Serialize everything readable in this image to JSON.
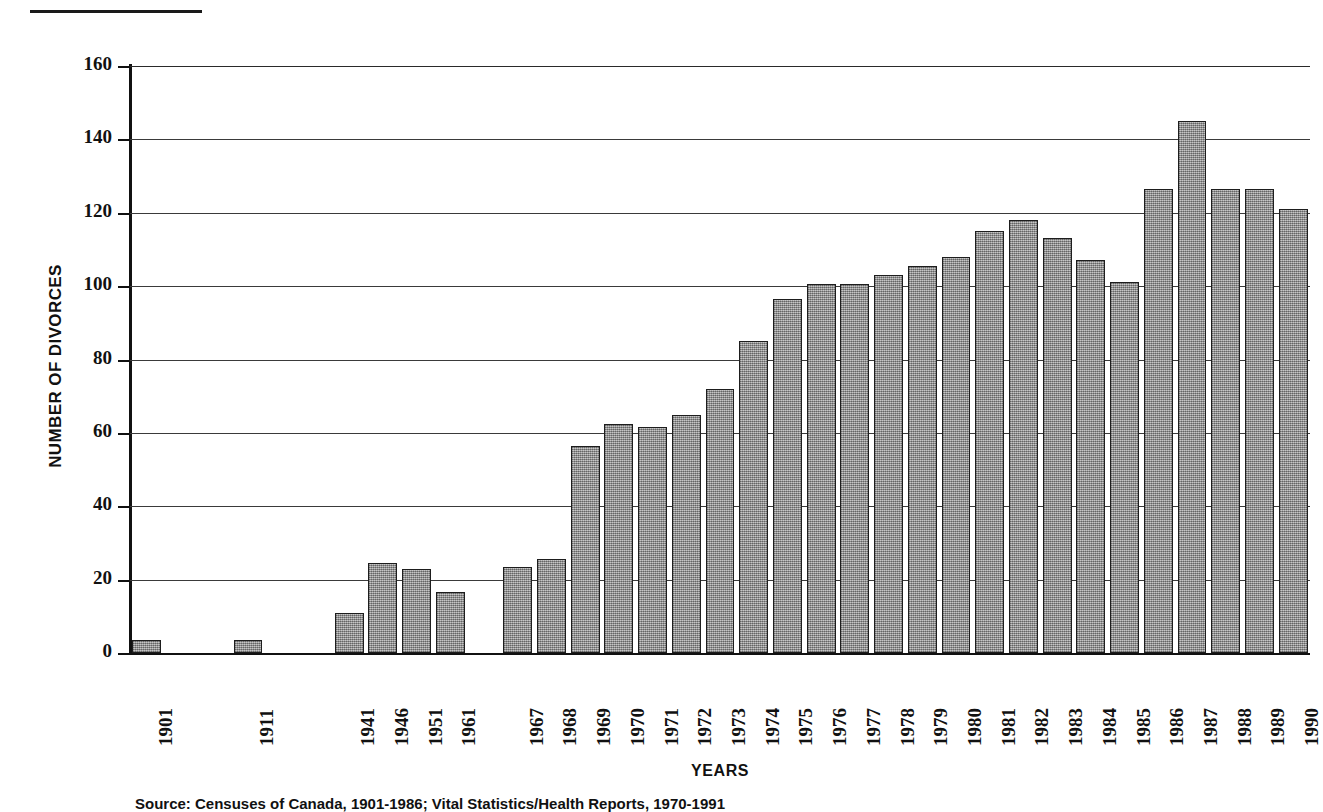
{
  "figure": {
    "rule_name": "top-divider-rule",
    "source_note": "Source: Censuses of Canada, 1901-1986; Vital Statistics/Health Reports, 1970-1991"
  },
  "chart_data": {
    "type": "bar",
    "title": "",
    "xlabel": "YEARS",
    "ylabel": "NUMBER OF DIVORCES",
    "ylim": [
      0,
      160
    ],
    "ytick_step": 20,
    "yticks": [
      0,
      20,
      40,
      60,
      80,
      100,
      120,
      140,
      160
    ],
    "ytick_labels": [
      "0",
      "20",
      "40",
      "60",
      "80",
      "100",
      "120",
      "140",
      "160"
    ],
    "grid": true,
    "legend": "none",
    "bar_color": "#9d9d9d",
    "bar_edge_color": "#1d1d1d",
    "axis_color": "#111111",
    "categories": [
      "1901",
      "1911",
      "1941",
      "1946",
      "1951",
      "1961",
      "1967",
      "1968",
      "1969",
      "1970",
      "1971",
      "1972",
      "1973",
      "1974",
      "1975",
      "1976",
      "1977",
      "1978",
      "1979",
      "1980",
      "1981",
      "1982",
      "1983",
      "1984",
      "1985",
      "1986",
      "1987",
      "1988",
      "1989",
      "1990"
    ],
    "values": [
      3.5,
      3.5,
      11,
      24.5,
      23,
      16.5,
      23.5,
      25.5,
      56.5,
      62.5,
      61.5,
      65,
      72,
      85,
      96.5,
      100.5,
      100.5,
      103,
      105.5,
      108,
      115,
      118,
      113,
      107,
      101,
      126.5,
      145,
      126.5,
      126.5,
      121
    ],
    "slot_count": 30,
    "gap_slots": {
      "after_1911": 2,
      "after_1961": 1
    }
  }
}
